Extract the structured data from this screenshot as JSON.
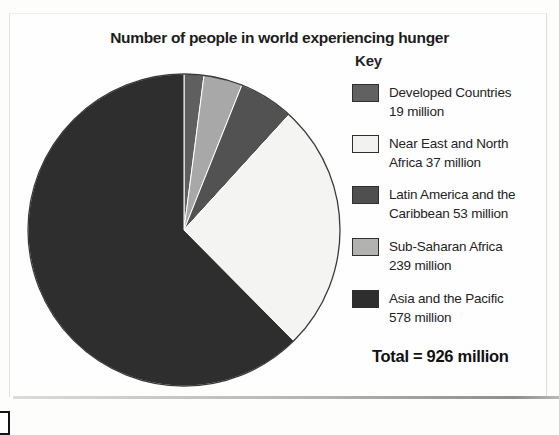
{
  "title": "Number of people in world experiencing hunger",
  "key": {
    "heading": "Key",
    "items": [
      {
        "lines": [
          "Developed Countries",
          "19 million"
        ],
        "swatch": "#616161"
      },
      {
        "lines": [
          "Near East and North",
          "Africa 37 million"
        ],
        "swatch": "#f2f2f0"
      },
      {
        "lines": [
          "Latin America and the",
          "Caribbean 53 million"
        ],
        "swatch": "#4f4f4f"
      },
      {
        "lines": [
          "Sub-Saharan Africa",
          "239 million"
        ],
        "swatch": "#b2b2b0"
      },
      {
        "lines": [
          "Asia and the Pacific",
          "578 million"
        ],
        "swatch": "#2e2e2e"
      }
    ],
    "total": "Total = 926 million"
  },
  "chart_data": {
    "type": "pie",
    "title": "Number of people in world experiencing hunger",
    "categories": [
      "Developed Countries",
      "Near East and North Africa",
      "Latin America and the Caribbean",
      "Sub-Saharan Africa",
      "Asia and the Pacific"
    ],
    "values": [
      19,
      37,
      53,
      239,
      578
    ],
    "unit": "million people",
    "total": 926,
    "start_angle_deg": 0,
    "direction": "clockwise",
    "slice_colors": [
      "#5f5f5f",
      "#a8a8a8",
      "#525252",
      "#f4f4f2",
      "#2e2e2e"
    ],
    "outline_color": "#3a3a3a",
    "legend_position": "right"
  }
}
